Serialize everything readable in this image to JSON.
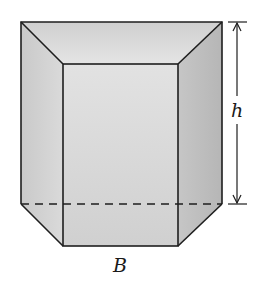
{
  "figure": {
    "type": "frustum-prism",
    "labels": {
      "height": "h",
      "base": "B"
    },
    "colors": {
      "stroke": "#1e1e1e",
      "front_face": "#dcdcdc",
      "top_face": "#d2d2d2",
      "left_face": "#cfcfcf",
      "right_face": "#c2c2c2",
      "bottom_left_face": "#d8d8d8",
      "bottom_right_face": "#bdbdbd",
      "background": "#ffffff"
    }
  }
}
